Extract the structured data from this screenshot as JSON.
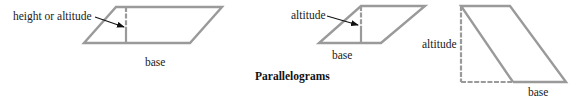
{
  "title": "Parallelograms",
  "figures": [
    {
      "id": "parallelogram-1",
      "labels": {
        "altitude": "height or altitude",
        "base": "base"
      }
    },
    {
      "id": "parallelogram-2",
      "labels": {
        "altitude": "altitude",
        "base": "base"
      }
    },
    {
      "id": "parallelogram-3",
      "labels": {
        "altitude": "altitude",
        "base": "base"
      }
    }
  ],
  "colors": {
    "stroke": "#9a9a9a",
    "text": "#1a1a1a"
  }
}
